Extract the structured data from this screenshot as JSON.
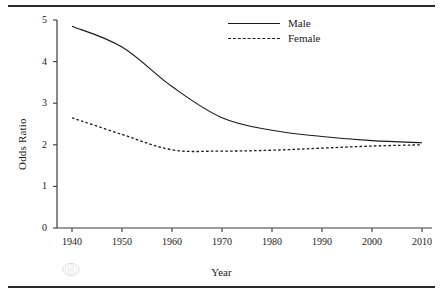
{
  "figure": {
    "watermark_icon": "circled-glyph-watermark"
  },
  "legend": {
    "position": "top-right",
    "entries": [
      {
        "label": "Male",
        "style": "solid",
        "swatch_icon": "solid-line-swatch"
      },
      {
        "label": "Female",
        "style": "dotted",
        "swatch_icon": "dashed-line-swatch"
      }
    ]
  },
  "chart_data": {
    "type": "line",
    "title": "",
    "subtitle": "",
    "xlabel": "Year",
    "ylabel": "Odds Ratio",
    "x": [
      1940,
      1950,
      1960,
      1970,
      1980,
      1990,
      2000,
      2010
    ],
    "categories": [
      "1940",
      "1950",
      "1960",
      "1970",
      "1980",
      "1990",
      "2000",
      "2010"
    ],
    "xlim": [
      1937,
      2012
    ],
    "ylim": [
      0,
      5
    ],
    "xticks": [
      1940,
      1950,
      1960,
      1970,
      1980,
      1990,
      2000,
      2010
    ],
    "xtick_labels": [
      "1940",
      "1950",
      "1960",
      "1970",
      "1980",
      "1990",
      "2000",
      "2010"
    ],
    "yticks": [
      0,
      1,
      2,
      3,
      4,
      5
    ],
    "ytick_labels": [
      "0",
      "1",
      "2",
      "3",
      "4",
      "5"
    ],
    "grid": false,
    "legend_position": "top-right",
    "series": [
      {
        "name": "Male",
        "style": "solid",
        "color": "#1b1b1b",
        "values": [
          4.85,
          4.35,
          3.4,
          2.65,
          2.35,
          2.2,
          2.1,
          2.05
        ]
      },
      {
        "name": "Female",
        "style": "dotted",
        "color": "#1b1b1b",
        "values": [
          2.65,
          2.25,
          1.88,
          1.85,
          1.87,
          1.92,
          1.97,
          2.0
        ]
      }
    ]
  }
}
